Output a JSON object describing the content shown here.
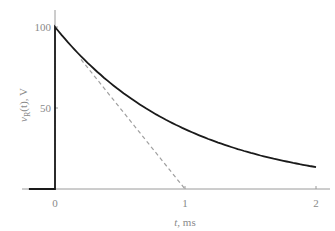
{
  "chart_data": {
    "type": "line",
    "title": "",
    "xlabel": "t, ms",
    "ylabel": "v_R(t), V",
    "ylabel_main": "v",
    "ylabel_sub": "R",
    "ylabel_rest": "(t), V",
    "xlabel_var": "t",
    "xlabel_rest": ", ms",
    "xlim": [
      -0.21,
      2.05
    ],
    "ylim": [
      0,
      105
    ],
    "grid": false,
    "legend": null,
    "x_ticks": [
      0,
      1,
      2
    ],
    "x_tick_labels": [
      "0",
      "1",
      "2"
    ],
    "y_ticks": [
      50,
      100
    ],
    "y_tick_labels": [
      "50",
      "100"
    ],
    "series": [
      {
        "name": "v_R(t) = 100 e^(-t/1ms)",
        "style": "solid",
        "color": "#1a1a1a",
        "x": [
          -0.2,
          0,
          0,
          0.25,
          0.5,
          0.75,
          1.0,
          1.25,
          1.5,
          1.75,
          2.0
        ],
        "values": [
          0,
          0,
          100,
          77.9,
          60.7,
          47.2,
          36.8,
          28.7,
          22.3,
          17.4,
          13.5
        ]
      },
      {
        "name": "initial tangent",
        "style": "dashed",
        "color": "#a0a0a0",
        "x": [
          0.2,
          1.0
        ],
        "values": [
          80,
          0
        ]
      }
    ],
    "annotations": []
  },
  "labels": {
    "tick_0": "0",
    "tick_1": "1",
    "tick_2": "2",
    "tick_50": "50",
    "tick_100": "100",
    "xlabel_var": "t",
    "xlabel_rest": ", ms",
    "ylabel_main": "v",
    "ylabel_sub": "R",
    "ylabel_rest": "(t), V"
  },
  "colors": {
    "curve": "#1a1a1a",
    "tangent": "#a0a0a0",
    "axis": "#9a9a9a",
    "text": "#8a8a8a"
  }
}
